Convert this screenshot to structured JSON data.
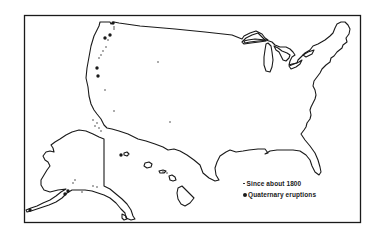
{
  "map": {
    "regions": [
      "Contiguous United States",
      "Alaska",
      "Hawaii"
    ],
    "colors": {
      "line": "#1a1a1a",
      "background": "#ffffff"
    }
  },
  "legend": {
    "items": [
      {
        "symbol": "small-dot",
        "label": "Since about 1800"
      },
      {
        "symbol": "large-dot",
        "label": "Quaternary eruptions"
      }
    ]
  },
  "markers": {
    "since_1800": [
      [
        114,
        27
      ],
      [
        114,
        29
      ],
      [
        108,
        40
      ],
      [
        106,
        47
      ],
      [
        103,
        51
      ],
      [
        101,
        55
      ],
      [
        99,
        58
      ],
      [
        158,
        62
      ],
      [
        105,
        90
      ],
      [
        114,
        111
      ],
      [
        170,
        122
      ],
      [
        93,
        120
      ],
      [
        97,
        123
      ],
      [
        95,
        126
      ],
      [
        99,
        128
      ],
      [
        101,
        131
      ],
      [
        75,
        180
      ],
      [
        73,
        183
      ],
      [
        93,
        186
      ],
      [
        97,
        187
      ],
      [
        82,
        192
      ],
      [
        163,
        172
      ],
      [
        167,
        173
      ]
    ],
    "quaternary": [
      [
        113,
        23
      ],
      [
        110,
        35
      ],
      [
        105,
        38
      ],
      [
        97,
        68
      ],
      [
        98,
        76
      ],
      [
        121,
        155
      ],
      [
        68,
        191
      ],
      [
        65,
        194
      ],
      [
        30,
        210
      ]
    ]
  }
}
